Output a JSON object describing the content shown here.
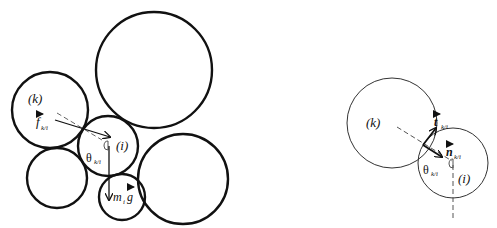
{
  "left_diagram": {
    "labels": {
      "k": "(k)",
      "i": "(i)",
      "force_main": "f",
      "force_sub": "k/i",
      "theta": "θ",
      "theta_sub": "k/i",
      "weight_m": "m",
      "weight_sub": "i",
      "weight_g": "g"
    }
  },
  "right_diagram": {
    "labels": {
      "k": "(k)",
      "i": "(i)",
      "tangent_main": "t",
      "tangent_sub": "k/i",
      "normal_main": "n",
      "normal_sub": "k/i",
      "theta": "θ",
      "theta_sub": "k/i"
    }
  },
  "colors": {
    "stroke": "#111111",
    "background": "#ffffff"
  }
}
